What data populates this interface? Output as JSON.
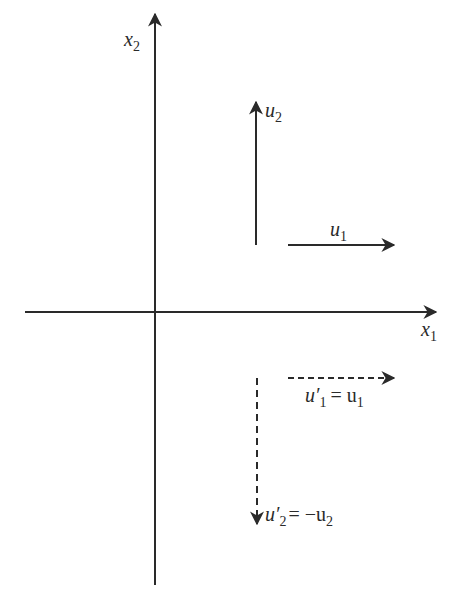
{
  "diagram": {
    "axes": {
      "x1": {
        "label": "x",
        "subscript": "1"
      },
      "x2": {
        "label": "x",
        "subscript": "2"
      }
    },
    "vectors": [
      {
        "id": "u1",
        "label": "u",
        "subscript": "1",
        "style": "solid",
        "direction": "right"
      },
      {
        "id": "u2",
        "label": "u",
        "subscript": "2",
        "style": "solid",
        "direction": "up"
      },
      {
        "id": "u1_prime",
        "label": "u′",
        "subscript": "1",
        "equation": "= u",
        "eq_subscript": "1",
        "style": "dashed",
        "direction": "right"
      },
      {
        "id": "u2_prime",
        "label": "u′",
        "subscript": "2",
        "equation": "= −u",
        "eq_subscript": "2",
        "style": "dashed",
        "direction": "down"
      }
    ],
    "colors": {
      "ink": "#2a2a2a",
      "background": "#ffffff"
    }
  }
}
